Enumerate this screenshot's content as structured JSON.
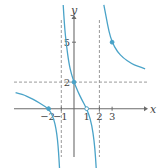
{
  "chart_data": {
    "type": "line",
    "title": "",
    "xlabel": "x",
    "ylabel": "y",
    "xlim": [
      -4.6,
      5.7
    ],
    "ylim": [
      -4.5,
      7.8
    ],
    "grid": false,
    "x_ticks": [
      {
        "value": -2,
        "label": "−2"
      },
      {
        "value": -1,
        "label": "−1"
      },
      {
        "value": 1,
        "label": "1"
      },
      {
        "value": 2,
        "label": "2"
      },
      {
        "value": 3,
        "label": "3"
      }
    ],
    "y_ticks": [
      {
        "value": 2,
        "label": "2"
      },
      {
        "value": 5,
        "label": "5"
      }
    ],
    "asymptotes": {
      "vertical": [
        -1,
        2
      ],
      "horizontal": [
        2
      ]
    },
    "series": [
      {
        "name": "left-branch",
        "points": [
          [
            -4.6,
            1.2
          ],
          [
            -4,
            1.05
          ],
          [
            -3.5,
            0.85
          ],
          [
            -3,
            0.6
          ],
          [
            -2.5,
            0.3
          ],
          [
            -2,
            0
          ],
          [
            -1.7,
            -0.5
          ],
          [
            -1.5,
            -1.1
          ],
          [
            -1.35,
            -1.9
          ],
          [
            -1.25,
            -2.8
          ],
          [
            -1.18,
            -3.8
          ],
          [
            -1.14,
            -4.5
          ]
        ]
      },
      {
        "name": "middle-branch",
        "points": [
          [
            -0.85,
            7.8
          ],
          [
            -0.75,
            6.2
          ],
          [
            -0.6,
            4.8
          ],
          [
            -0.4,
            3.4
          ],
          [
            -0.2,
            2.6
          ],
          [
            0,
            2
          ],
          [
            0.3,
            1.3
          ],
          [
            0.6,
            0.7
          ],
          [
            1,
            0
          ],
          [
            1.3,
            -0.8
          ],
          [
            1.5,
            -1.8
          ],
          [
            1.65,
            -3.0
          ],
          [
            1.75,
            -4.5
          ]
        ]
      },
      {
        "name": "right-branch",
        "points": [
          [
            2.35,
            7.8
          ],
          [
            2.55,
            6.8
          ],
          [
            2.75,
            5.8
          ],
          [
            3,
            5
          ],
          [
            3.4,
            4.3
          ],
          [
            3.9,
            3.8
          ],
          [
            4.5,
            3.4
          ],
          [
            5.0,
            3.2
          ],
          [
            5.6,
            3.0
          ]
        ]
      }
    ],
    "marked_points": [
      {
        "x": -2,
        "y": 0,
        "style": "filled"
      },
      {
        "x": 0,
        "y": 2,
        "style": "filled"
      },
      {
        "x": 1,
        "y": 0,
        "style": "open"
      },
      {
        "x": 3,
        "y": 5,
        "style": "filled"
      }
    ],
    "colors": {
      "curve": "#4aa3c8",
      "axis": "#6b6b6b",
      "asymptote": "#9a9a9a"
    }
  }
}
